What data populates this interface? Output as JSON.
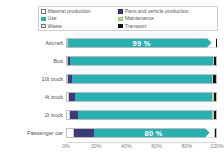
{
  "chart_data": {
    "type": "bar",
    "subtype": "horizontal-stacked-100-percent",
    "title": "",
    "xlabel": "",
    "ylabel": "",
    "xlim": [
      0,
      100
    ],
    "xticks": [
      "0%",
      "20%",
      "40%",
      "60%",
      "80%",
      "100%"
    ],
    "xtick_values": [
      0,
      20,
      40,
      60,
      80,
      100
    ],
    "grid": false,
    "legend_position": "top",
    "categories": [
      "Aircraft",
      "Bus",
      "10t truck",
      "4t truck",
      "2t truck",
      "Passenger car"
    ],
    "series": [
      {
        "name": "Material production",
        "color": "#ffffff",
        "values": [
          0.3,
          0.6,
          1.0,
          1.4,
          2.0,
          5.0
        ]
      },
      {
        "name": "Parts and vehicle production",
        "color": "#3d3a78",
        "values": [
          0.2,
          1.2,
          2.6,
          4.0,
          5.2,
          13.0
        ]
      },
      {
        "name": "Use",
        "color": "#2ab0b0",
        "values": [
          99.0,
          96.5,
          94.0,
          92.0,
          90.0,
          80.0
        ]
      },
      {
        "name": "Maintenance",
        "color": "#b5d98c",
        "values": [
          0.2,
          0.3,
          0.4,
          0.6,
          0.8,
          1.0
        ]
      },
      {
        "name": "Waste",
        "color": "#ffffff",
        "values": [
          0.1,
          0.2,
          0.3,
          0.4,
          0.5,
          0.5
        ]
      },
      {
        "name": "Transport",
        "color": "#111111",
        "values": [
          0.2,
          1.2,
          1.7,
          1.6,
          1.5,
          0.5
        ]
      }
    ],
    "annotations": [
      {
        "category": "Aircraft",
        "label": "99 %",
        "series": "Use"
      },
      {
        "category": "Passenger car",
        "label": "80 %",
        "series": "Use"
      }
    ]
  },
  "legend": {
    "columns": [
      {
        "items": [
          {
            "label": "Material production",
            "swatch_color": "#ffffff",
            "icon": "legend-swatch-icon"
          },
          {
            "label": "Use",
            "swatch_color": "#2ab0b0",
            "icon": "legend-swatch-icon"
          },
          {
            "label": "Waste",
            "swatch_color": "#e8eaec",
            "icon": "legend-swatch-icon"
          }
        ]
      },
      {
        "items": [
          {
            "label": "Parts and vehicle production",
            "swatch_color": "#3d3a78",
            "icon": "legend-swatch-icon"
          },
          {
            "label": "Maintenance",
            "swatch_color": "#b5d98c",
            "icon": "legend-swatch-icon"
          },
          {
            "label": "Transport",
            "swatch_color": "#111111",
            "icon": "legend-swatch-icon"
          }
        ]
      }
    ]
  },
  "colors": {
    "use": "#2ab0b0",
    "parts": "#3d3a78",
    "transport": "#111111",
    "maintenance": "#b5d98c",
    "material": "#ffffff",
    "waste": "#e8eaec",
    "bar_outline": "#b9bdc2",
    "text": "#4d5256",
    "tick_text": "#7c8185"
  }
}
